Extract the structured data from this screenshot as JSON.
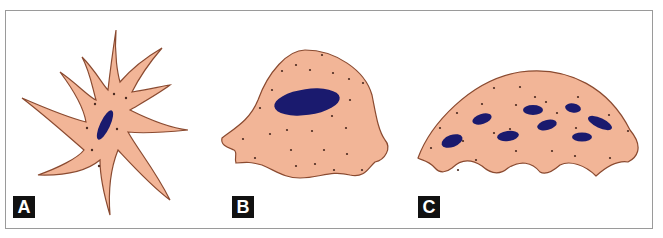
{
  "figure": {
    "panels": [
      {
        "label": "A",
        "description": "Stellate cell with many long tapering processes and single elongated nucleus"
      },
      {
        "label": "B",
        "description": "Dome-shaped cell with single oval nucleus"
      },
      {
        "label": "C",
        "description": "Broad dome-shaped multinucleated cell with wavy base"
      }
    ],
    "colors": {
      "cytoplasm": "#f2b597",
      "outline": "#8a4a30",
      "nucleus": "#1a1a6e",
      "granule": "#4a2a20",
      "label_bg": "#111111",
      "label_text": "#ffffff",
      "frame": "#9a9a9a"
    }
  }
}
